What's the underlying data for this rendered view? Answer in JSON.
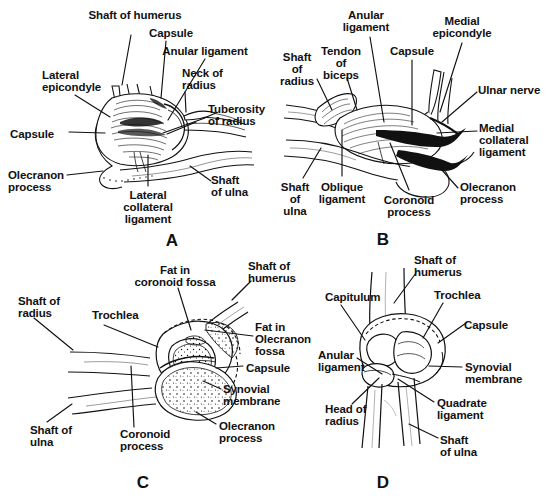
{
  "figure": {
    "background": "#ffffff",
    "ink": "#111111",
    "panel_letters": [
      {
        "id": "A",
        "text": "A",
        "x": 172,
        "y": 231
      },
      {
        "id": "B",
        "text": "B",
        "x": 383,
        "y": 230
      },
      {
        "id": "C",
        "text": "C",
        "x": 143,
        "y": 473
      },
      {
        "id": "D",
        "text": "D",
        "x": 383,
        "y": 473
      }
    ]
  },
  "panels": {
    "A": {
      "letter": "A",
      "view": "lateral view of elbow joint",
      "labels": [
        {
          "name": "shaft-of-humerus",
          "text": "Shaft of humerus",
          "x": 135,
          "y": 10,
          "align": "c"
        },
        {
          "name": "capsule-top",
          "text": "Capsule",
          "x": 171,
          "y": 28,
          "align": "c"
        },
        {
          "name": "anular-ligament",
          "text": "Anular ligament",
          "x": 205,
          "y": 46,
          "align": "c"
        },
        {
          "name": "neck-of-radius",
          "text": "Neck of\nradius",
          "x": 182,
          "y": 68,
          "align": "l"
        },
        {
          "name": "tuberosity-of-radius",
          "text": "Tuberosity\nof radius",
          "x": 208,
          "y": 104,
          "align": "l"
        },
        {
          "name": "lateral-epicondyle",
          "text": "Lateral\nepicondyle",
          "x": 42,
          "y": 70,
          "align": "l"
        },
        {
          "name": "capsule-left",
          "text": "Capsule",
          "x": 10,
          "y": 129,
          "align": "l"
        },
        {
          "name": "olecranon-process",
          "text": "Olecranon\nprocess",
          "x": 8,
          "y": 170,
          "align": "l"
        },
        {
          "name": "lateral-collateral-ligament",
          "text": "Lateral\ncollateral\nligament",
          "x": 148,
          "y": 190,
          "align": "c"
        },
        {
          "name": "shaft-of-ulna",
          "text": "Shaft\nof ulna",
          "x": 211,
          "y": 175,
          "align": "l"
        }
      ]
    },
    "B": {
      "letter": "B",
      "view": "medial view of elbow joint",
      "labels": [
        {
          "name": "anular-ligament",
          "text": "Anular\nligament",
          "x": 366,
          "y": 10,
          "align": "c"
        },
        {
          "name": "medial-epicondyle",
          "text": "Medial\nepicondyle",
          "x": 462,
          "y": 16,
          "align": "c"
        },
        {
          "name": "tendon-of-biceps",
          "text": "Tendon\nof\nbiceps",
          "x": 341,
          "y": 46,
          "align": "c"
        },
        {
          "name": "capsule",
          "text": "Capsule",
          "x": 412,
          "y": 46,
          "align": "c"
        },
        {
          "name": "shaft-of-radius",
          "text": "Shaft\nof\nradius",
          "x": 297,
          "y": 52,
          "align": "c"
        },
        {
          "name": "ulnar-nerve",
          "text": "Ulnar nerve",
          "x": 478,
          "y": 85,
          "align": "l"
        },
        {
          "name": "medial-collateral-ligament",
          "text": "Medial\ncollateral\nligament",
          "x": 479,
          "y": 123,
          "align": "l"
        },
        {
          "name": "olecranon-process",
          "text": "Olecranon\nprocess",
          "x": 460,
          "y": 182,
          "align": "l"
        },
        {
          "name": "shaft-of-ulna",
          "text": "Shaft\nof\nulna",
          "x": 295,
          "y": 182,
          "align": "c"
        },
        {
          "name": "oblique-ligament",
          "text": "Oblique\nligament",
          "x": 342,
          "y": 182,
          "align": "c"
        },
        {
          "name": "coronoid-process",
          "text": "Coronoid\nprocess",
          "x": 409,
          "y": 195,
          "align": "c"
        }
      ]
    },
    "C": {
      "letter": "C",
      "view": "sagittal section of elbow joint",
      "labels": [
        {
          "name": "fat-in-coronoid-fossa",
          "text": "Fat in\ncoronoid fossa",
          "x": 175,
          "y": 265,
          "align": "c"
        },
        {
          "name": "shaft-of-humerus",
          "text": "Shaft of\nhumerus",
          "x": 248,
          "y": 261,
          "align": "l"
        },
        {
          "name": "shaft-of-radius",
          "text": "Shaft of\nradius",
          "x": 18,
          "y": 296,
          "align": "l"
        },
        {
          "name": "trochlea",
          "text": "Trochlea",
          "x": 92,
          "y": 310,
          "align": "l"
        },
        {
          "name": "fat-in-olecranon-fossa",
          "text": "Fat in\nOlecranon\nfossa",
          "x": 255,
          "y": 322,
          "align": "l"
        },
        {
          "name": "capsule",
          "text": "Capsule",
          "x": 246,
          "y": 363,
          "align": "l"
        },
        {
          "name": "synovial-membrane",
          "text": "Synovial\nmembrane",
          "x": 223,
          "y": 384,
          "align": "l"
        },
        {
          "name": "olecranon-process",
          "text": "Olecranon\nprocess",
          "x": 219,
          "y": 421,
          "align": "l"
        },
        {
          "name": "shaft-of-ulna",
          "text": "Shaft of\nulna",
          "x": 30,
          "y": 425,
          "align": "l"
        },
        {
          "name": "coronoid-process",
          "text": "Coronoid\nprocess",
          "x": 120,
          "y": 429,
          "align": "l"
        }
      ]
    },
    "D": {
      "letter": "D",
      "view": "anterior view of elbow joint",
      "labels": [
        {
          "name": "shaft-of-humerus",
          "text": "Shaft of\nhumerus",
          "x": 414,
          "y": 255,
          "align": "l"
        },
        {
          "name": "capitulum",
          "text": "Capitulum",
          "x": 325,
          "y": 292,
          "align": "l"
        },
        {
          "name": "trochlea",
          "text": "Trochlea",
          "x": 434,
          "y": 290,
          "align": "l"
        },
        {
          "name": "capsule",
          "text": "Capsule",
          "x": 464,
          "y": 320,
          "align": "l"
        },
        {
          "name": "anular-ligament",
          "text": "Anular\nligament",
          "x": 318,
          "y": 350,
          "align": "l"
        },
        {
          "name": "synovial-membrane",
          "text": "Synovial\nmembrane",
          "x": 465,
          "y": 362,
          "align": "l"
        },
        {
          "name": "quadrate-ligament",
          "text": "Quadrate\nligament",
          "x": 437,
          "y": 398,
          "align": "l"
        },
        {
          "name": "head-of-radius",
          "text": "Head of\nradius",
          "x": 325,
          "y": 404,
          "align": "l"
        },
        {
          "name": "shaft-of-ulna",
          "text": "Shaft\nof ulna",
          "x": 440,
          "y": 435,
          "align": "l"
        }
      ]
    }
  },
  "leaders": {
    "A": [
      [
        131,
        35,
        122,
        85
      ],
      [
        166,
        41,
        161,
        98
      ],
      [
        205,
        59,
        168,
        120
      ],
      [
        185,
        92,
        186,
        112
      ],
      [
        205,
        118,
        163,
        133
      ],
      [
        196,
        122,
        167,
        134
      ],
      [
        75,
        95,
        110,
        117
      ],
      [
        69,
        132,
        105,
        133
      ],
      [
        67,
        175,
        103,
        171
      ],
      [
        148,
        186,
        148,
        155
      ],
      [
        211,
        181,
        190,
        166
      ]
    ],
    "B": [
      [
        370,
        37,
        384,
        122
      ],
      [
        462,
        43,
        440,
        112
      ],
      [
        347,
        78,
        357,
        110
      ],
      [
        412,
        60,
        412,
        125
      ],
      [
        317,
        79,
        332,
        110
      ],
      [
        477,
        92,
        442,
        122
      ],
      [
        477,
        131,
        437,
        133
      ],
      [
        458,
        188,
        441,
        169
      ],
      [
        303,
        178,
        321,
        148
      ],
      [
        342,
        176,
        342,
        130
      ],
      [
        409,
        190,
        390,
        143
      ]
    ],
    "C": [
      [
        178,
        288,
        191,
        330
      ],
      [
        251,
        281,
        232,
        300
      ],
      [
        34,
        318,
        73,
        350
      ],
      [
        104,
        325,
        158,
        347
      ],
      [
        253,
        336,
        205,
        330
      ],
      [
        243,
        366,
        216,
        368
      ],
      [
        221,
        389,
        203,
        381
      ],
      [
        216,
        424,
        196,
        412
      ],
      [
        47,
        422,
        72,
        404
      ],
      [
        134,
        427,
        131,
        366
      ]
    ],
    "D": [
      [
        416,
        273,
        394,
        303
      ],
      [
        341,
        305,
        365,
        340
      ],
      [
        443,
        303,
        423,
        338
      ],
      [
        466,
        323,
        438,
        343
      ],
      [
        357,
        358,
        382,
        374
      ],
      [
        462,
        367,
        429,
        366
      ],
      [
        434,
        402,
        398,
        379
      ],
      [
        352,
        404,
        379,
        378
      ],
      [
        438,
        438,
        409,
        424
      ]
    ]
  }
}
